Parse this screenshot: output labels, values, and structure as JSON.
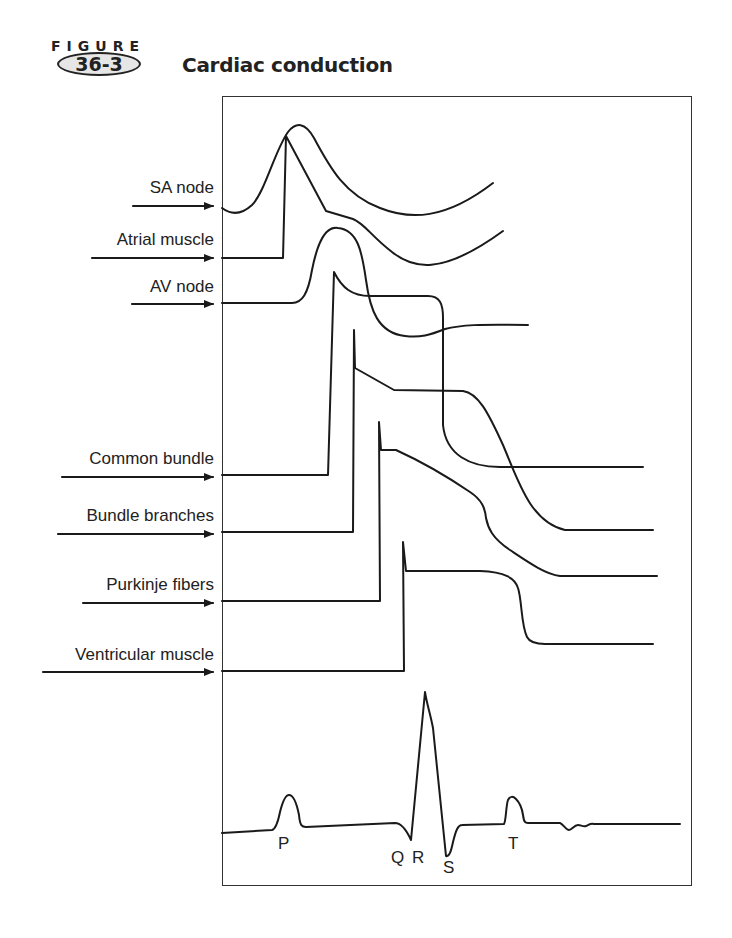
{
  "figure": {
    "label": "FIGURE",
    "number": "36-3",
    "title": "Cardiac conduction"
  },
  "rows": [
    {
      "label": "SA node",
      "y": 206
    },
    {
      "label": "Atrial muscle",
      "y": 258
    },
    {
      "label": "AV node",
      "y": 304
    },
    {
      "label": "Common bundle",
      "y": 476
    },
    {
      "label": "Bundle branches",
      "y": 532
    },
    {
      "label": "Purkinje fibers",
      "y": 602
    },
    {
      "label": "Ventricular muscle",
      "y": 672
    }
  ],
  "ecg": {
    "labels": {
      "p": "P",
      "q": "Q",
      "r": "R",
      "s": "S",
      "t": "T"
    }
  },
  "colors": {
    "line": "#1a1a1a",
    "oval_fill": "#e6e6e6"
  }
}
